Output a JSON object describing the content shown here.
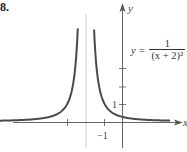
{
  "problem_number": "8.",
  "equation": {
    "lhs": "y =",
    "numerator": "1",
    "denominator": "(x + 2)²"
  },
  "chart_data": {
    "type": "line",
    "title": "",
    "function": "y = 1/(x+2)^2",
    "xlabel": "x",
    "ylabel": "y",
    "xlim": [
      -8.7,
      3.5
    ],
    "ylim": [
      -1.8,
      6.7
    ],
    "vertical_asymptote": -2,
    "horizontal_asymptote": 0,
    "x_ticks": [
      -3,
      -1
    ],
    "x_tick_labels": [
      "",
      "−1"
    ],
    "y_ticks": [
      1,
      2,
      3
    ],
    "y_tick_labels": [
      "1",
      "",
      ""
    ],
    "grid": false,
    "series": [
      {
        "name": "left branch",
        "x": [
          -8.2,
          -5,
          -4,
          -3,
          -2.5,
          -2.3,
          -2.19
        ],
        "y": [
          0.026,
          0.111,
          0.25,
          1,
          4,
          11.1,
          27.7
        ]
      },
      {
        "name": "right branch",
        "x": [
          -1.81,
          -1.7,
          -1.5,
          -1,
          0,
          1,
          2.4
        ],
        "y": [
          27.7,
          11.1,
          4,
          1,
          0.25,
          0.111,
          0.052
        ]
      }
    ]
  },
  "style": {
    "curve_color": "#4a4a4a",
    "axis_color": "#555555",
    "asymptote_color": "#bbbbbb"
  }
}
